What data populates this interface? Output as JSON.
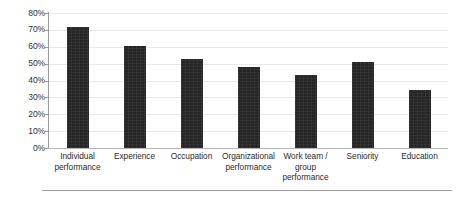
{
  "chart_data": {
    "type": "bar",
    "title": "",
    "subtitle": "",
    "xlabel": "",
    "ylabel": "",
    "categories": [
      "Individual performance",
      "Experience",
      "Occupation",
      "Organizational performance",
      "Work team / group performance",
      "Seniority",
      "Education"
    ],
    "category_lines": [
      [
        "Individual",
        "performance"
      ],
      [
        "Experience"
      ],
      [
        "Occupation"
      ],
      [
        "Organizational",
        "performance"
      ],
      [
        "Work team /",
        "group",
        "performance"
      ],
      [
        "Seniority"
      ],
      [
        "Education"
      ]
    ],
    "values": [
      72,
      60.5,
      53,
      48,
      43.5,
      51,
      34.5
    ],
    "value_labels": [
      "72%",
      "60.5%",
      "53%",
      "48%",
      "43.5%",
      "51%",
      "34.5%"
    ],
    "ylim": [
      0,
      80
    ],
    "ytick_values": [
      0,
      10,
      20,
      30,
      40,
      50,
      60,
      70,
      80
    ],
    "ytick_labels": [
      "0%",
      "10%",
      "20%",
      "30%",
      "40%",
      "50%",
      "60%",
      "70%",
      "80%"
    ],
    "grid": true,
    "grid_axis": "y",
    "legend": false,
    "legend_position": "none",
    "series": [
      {
        "name": "",
        "values": [
          72,
          60.5,
          53,
          48,
          43.5,
          51,
          34.5
        ]
      }
    ]
  },
  "style": {
    "bar_color": "#262626",
    "grid_color": "#e9e9e9",
    "axis_color": "#9a9a9a",
    "baseline_color": "#b4b4b4",
    "text_color": "#2b2b2b",
    "background": "#ffffff",
    "rule_color": "#9e9e9e"
  }
}
